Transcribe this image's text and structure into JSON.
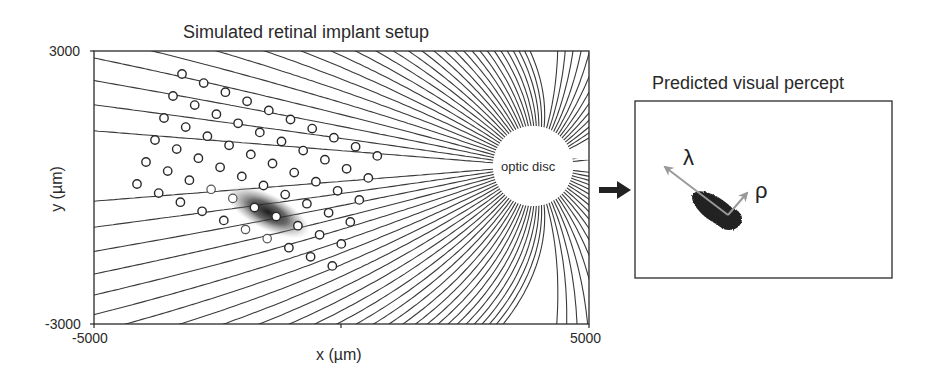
{
  "left_panel": {
    "title": "Simulated retinal implant setup",
    "xlabel": "x (µm)",
    "ylabel": "y (µm)",
    "x_ticks": [
      "-5000",
      "5000"
    ],
    "y_ticks": [
      "3000",
      "-3000"
    ],
    "xlim": [
      -5000,
      5000
    ],
    "ylim": [
      -3000,
      3000
    ],
    "optic_disc_label": "optic disc",
    "electrode_grid": {
      "rows": 6,
      "cols": 10,
      "activated": [
        [
          5,
          5
        ],
        [
          5,
          6
        ]
      ]
    }
  },
  "right_panel": {
    "title": "Predicted visual percept",
    "axis_labels": {
      "lambda": "λ",
      "rho": "ρ"
    }
  },
  "colors": {
    "ink": "#2a2a2a",
    "axon_line": "#3a3a3a",
    "arrow_gray": "#999999",
    "percept_blob": "#222222"
  },
  "chart_data": {
    "type": "diagram",
    "title": "Simulated retinal implant setup",
    "xlabel": "x (µm)",
    "ylabel": "y (µm)",
    "xlim": [
      -5000,
      5000
    ],
    "ylim": [
      -3000,
      3000
    ],
    "annotations": [
      "optic disc",
      "Predicted visual percept",
      "λ",
      "ρ"
    ]
  }
}
